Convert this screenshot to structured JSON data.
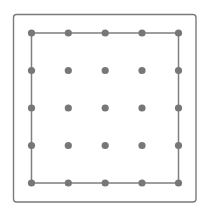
{
  "diagram": {
    "type": "geoboard",
    "grid": {
      "rows": 5,
      "cols": 5
    },
    "frame": {
      "x": 13.5,
      "y": 14.5,
      "width": 182.5,
      "height": 187.5,
      "radius": 3,
      "stroke": "#7a7a7a",
      "stroke_width": 1.4
    },
    "dot_grid": {
      "x_positions": [
        31.5,
        68.3,
        105.2,
        142,
        178.5
      ],
      "y_positions": [
        33,
        70.5,
        108,
        145.5,
        183
      ],
      "radius": 3.6,
      "fill": "#777777"
    },
    "polygon": {
      "shape": "square",
      "vertices": [
        [
          0,
          0
        ],
        [
          4,
          0
        ],
        [
          4,
          4
        ],
        [
          0,
          4
        ]
      ],
      "stroke": "#7f7f7f",
      "stroke_width": 1.5
    }
  }
}
